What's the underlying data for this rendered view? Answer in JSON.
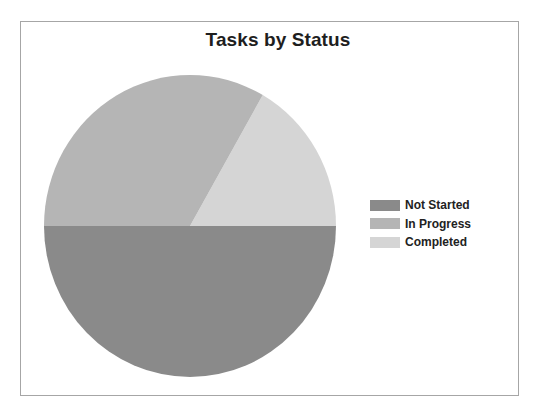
{
  "chart_data": {
    "type": "pie",
    "title": "Tasks by Status",
    "categories": [
      "Not Started",
      "In Progress",
      "Completed"
    ],
    "values": [
      50,
      33.3,
      16.7
    ],
    "unit": "percent (estimated from slice angles)",
    "colors": [
      "#8a8a8a",
      "#b5b5b5",
      "#d5d5d5"
    ],
    "start_angle_deg": 0,
    "direction": "Completed from 0° to ~60° (counter-clockwise from 3 o'clock), In Progress ~60°–180°, Not Started 180°–360°",
    "legend_position": "right",
    "data_labels": false
  },
  "legend": {
    "items": [
      {
        "label": "Not Started",
        "color": "#8a8a8a"
      },
      {
        "label": "In Progress",
        "color": "#b5b5b5"
      },
      {
        "label": "Completed",
        "color": "#d5d5d5"
      }
    ]
  },
  "style": {
    "frame_border": "#a6a6a6",
    "background": "#ffffff",
    "title_color": "#1e1e1e"
  }
}
